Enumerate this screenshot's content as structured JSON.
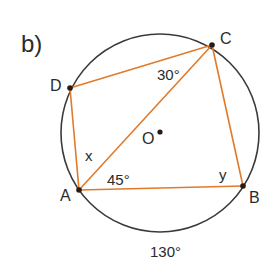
{
  "figure": {
    "part_label": "b)",
    "circle": {
      "center_label": "O",
      "stroke": "#3a3a3a"
    },
    "chord_color": "#e07b2a",
    "points": {
      "A": "A",
      "B": "B",
      "C": "C",
      "D": "D"
    },
    "angles": {
      "DCA": "30°",
      "CAB": "45°",
      "DAC": "x",
      "ABC": "y",
      "arc_AB": "130°"
    }
  }
}
